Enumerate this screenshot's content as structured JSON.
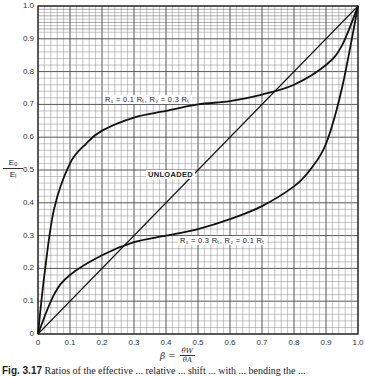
{
  "figure": {
    "caption_number": "Fig. 3.17",
    "caption_text": "Ratios of the effective ... relative ... shift ... with ... bending the ..."
  },
  "axes": {
    "y_label_numerator": "Eₒ",
    "y_label_denominator": "Eᵢ",
    "x_label_beta": "β =",
    "x_label_numerator": "θW",
    "x_label_denominator": "θA"
  },
  "labels": {
    "upper": "R₁ = 0.1 Rₜ, R₂ = 0.3 Rₜ",
    "unloaded": "UNLOADED",
    "lower": "R₁ = 0.3 Rₜ, R₂ = 0.1 Rₜ"
  },
  "chart_data": {
    "type": "line",
    "title": "",
    "xlabel": "β = θW / θA",
    "ylabel": "Eo / Ei",
    "xlim": [
      0,
      1.0
    ],
    "ylim": [
      0,
      1.0
    ],
    "grid": true,
    "grid_minor_step": 0.02,
    "grid_major_step": 0.1,
    "x_ticks": [
      "0",
      "0.1",
      "0.2",
      "0.3",
      "0.4",
      "0.5",
      "0.6",
      "0.7",
      "0.8",
      "0.9",
      "1.0"
    ],
    "y_ticks": [
      "0",
      "0.1",
      "0.2",
      "0.3",
      "0.4",
      "0.5",
      "0.6",
      "0.7",
      "0.8",
      "0.9",
      "1.0"
    ],
    "series": [
      {
        "name": "R1 = 0.1 RT, R2 = 0.3 RT",
        "x": [
          0,
          0.02,
          0.05,
          0.1,
          0.15,
          0.2,
          0.3,
          0.4,
          0.5,
          0.6,
          0.7,
          0.8,
          0.9,
          0.95,
          1.0
        ],
        "y": [
          0,
          0.18,
          0.38,
          0.52,
          0.58,
          0.62,
          0.66,
          0.68,
          0.7,
          0.71,
          0.73,
          0.76,
          0.82,
          0.88,
          1.0
        ]
      },
      {
        "name": "UNLOADED",
        "x": [
          0,
          1.0
        ],
        "y": [
          0,
          1.0
        ]
      },
      {
        "name": "R1 = 0.3 RT, R2 = 0.1 RT",
        "x": [
          0,
          0.05,
          0.1,
          0.2,
          0.3,
          0.4,
          0.5,
          0.6,
          0.7,
          0.8,
          0.85,
          0.9,
          0.95,
          1.0
        ],
        "y": [
          0,
          0.12,
          0.18,
          0.24,
          0.28,
          0.3,
          0.32,
          0.35,
          0.39,
          0.45,
          0.5,
          0.58,
          0.75,
          1.0
        ]
      }
    ]
  }
}
